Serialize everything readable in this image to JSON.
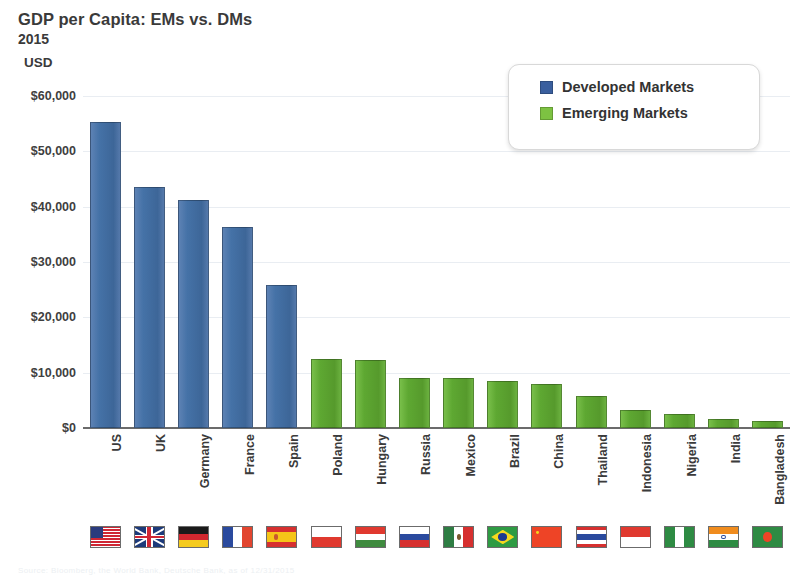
{
  "header": {
    "title": "GDP per Capita: EMs vs. DMs",
    "subtitle": "2015",
    "unit_label": "USD"
  },
  "legend": {
    "position": "top-right",
    "items": [
      {
        "label": "Developed Markets",
        "color": "#3a5f9e",
        "key": "dm"
      },
      {
        "label": "Emerging Markets",
        "color": "#7dc242",
        "key": "em"
      }
    ]
  },
  "colors": {
    "developed_markets": "#4572a7",
    "emerging_markets": "#5ea832",
    "gridline": "#e9edf2",
    "axis": "#6b6b6b",
    "text": "#3a3a3a"
  },
  "source_note": "Source: Bloomberg, the World Bank, Deutsche Bank, as of 12/31/2015",
  "chart_data": {
    "type": "bar",
    "title": "GDP per Capita: EMs vs. DMs",
    "subtitle": "2015",
    "xlabel": "",
    "ylabel": "USD",
    "ylim": [
      0,
      60000
    ],
    "ytick_values": [
      0,
      10000,
      20000,
      30000,
      40000,
      50000,
      60000
    ],
    "ytick_labels": [
      "$0",
      "$10,000",
      "$20,000",
      "$30,000",
      "$40,000",
      "$50,000",
      "$60,000"
    ],
    "grid": true,
    "categories": [
      "US",
      "UK",
      "Germany",
      "France",
      "Spain",
      "Poland",
      "Hungary",
      "Russia",
      "Mexico",
      "Brazil",
      "China",
      "Thailand",
      "Indonesia",
      "Nigeria",
      "India",
      "Bangladesh"
    ],
    "values": [
      55300,
      43500,
      41200,
      36300,
      25800,
      12400,
      12300,
      9100,
      9000,
      8500,
      7900,
      5800,
      3300,
      2600,
      1600,
      1200
    ],
    "groups": [
      "Developed Markets",
      "Developed Markets",
      "Developed Markets",
      "Developed Markets",
      "Developed Markets",
      "Emerging Markets",
      "Emerging Markets",
      "Emerging Markets",
      "Emerging Markets",
      "Emerging Markets",
      "Emerging Markets",
      "Emerging Markets",
      "Emerging Markets",
      "Emerging Markets",
      "Emerging Markets",
      "Emerging Markets"
    ],
    "series": [
      {
        "name": "Developed Markets",
        "color": "#4572a7",
        "points": [
          {
            "category": "US",
            "value": 55300
          },
          {
            "category": "UK",
            "value": 43500
          },
          {
            "category": "Germany",
            "value": 41200
          },
          {
            "category": "France",
            "value": 36300
          },
          {
            "category": "Spain",
            "value": 25800
          }
        ]
      },
      {
        "name": "Emerging Markets",
        "color": "#5ea832",
        "points": [
          {
            "category": "Poland",
            "value": 12400
          },
          {
            "category": "Hungary",
            "value": 12300
          },
          {
            "category": "Russia",
            "value": 9100
          },
          {
            "category": "Mexico",
            "value": 9000
          },
          {
            "category": "Brazil",
            "value": 8500
          },
          {
            "category": "China",
            "value": 7900
          },
          {
            "category": "Thailand",
            "value": 5800
          },
          {
            "category": "Indonesia",
            "value": 3300
          },
          {
            "category": "Nigeria",
            "value": 2600
          },
          {
            "category": "India",
            "value": 1600
          },
          {
            "category": "Bangladesh",
            "value": 1200
          }
        ]
      }
    ],
    "flags": [
      "US",
      "UK",
      "Germany",
      "France",
      "Spain",
      "Poland",
      "Hungary",
      "Russia",
      "Mexico",
      "Brazil",
      "China",
      "Thailand",
      "Indonesia",
      "Nigeria",
      "India",
      "Bangladesh"
    ]
  }
}
